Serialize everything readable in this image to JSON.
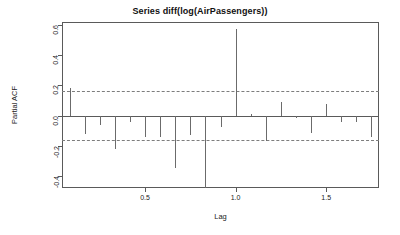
{
  "chart_data": {
    "type": "bar",
    "title": "Series  diff(log(AirPassengers))",
    "xlabel": "Lag",
    "ylabel": "Partial ACF",
    "xlim": [
      0.0417,
      1.7917
    ],
    "ylim": [
      -0.48,
      0.62
    ],
    "grid": false,
    "legend": null,
    "confidence_level": 0.95,
    "confidence_bounds": [
      0.163,
      -0.163
    ],
    "x_ticks": [
      0.5,
      1.0,
      1.5
    ],
    "x_tick_labels": [
      "0.5",
      "1.0",
      "1.5"
    ],
    "y_ticks": [
      0.6,
      0.4,
      0.2,
      0.0,
      -0.2,
      -0.4
    ],
    "y_tick_labels": [
      "0.6",
      "0.4",
      "0.2",
      "0.0",
      "-0.2",
      "-0.4"
    ],
    "x": [
      0.0833,
      0.1667,
      0.25,
      0.3333,
      0.4167,
      0.5,
      0.5833,
      0.6667,
      0.75,
      0.8333,
      0.9167,
      1.0,
      1.0833,
      1.1667,
      1.25,
      1.3333,
      1.4167,
      1.5,
      1.5833,
      1.6667,
      1.75
    ],
    "values": [
      0.185,
      -0.123,
      -0.065,
      -0.22,
      -0.04,
      -0.145,
      -0.14,
      -0.345,
      -0.13,
      -0.495,
      -0.075,
      0.572,
      0.012,
      -0.17,
      0.088,
      -0.015,
      -0.115,
      0.075,
      -0.04,
      -0.045,
      -0.145
    ],
    "lags": [
      1,
      2,
      3,
      4,
      5,
      6,
      7,
      8,
      9,
      10,
      11,
      12,
      13,
      14,
      15,
      16,
      17,
      18,
      19,
      20,
      21
    ],
    "annotations": []
  }
}
